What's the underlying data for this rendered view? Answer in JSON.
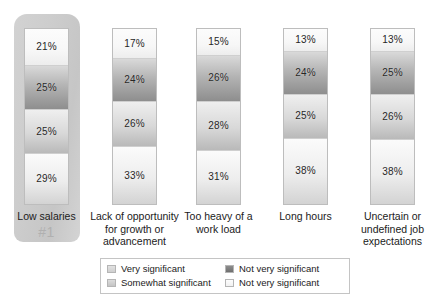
{
  "chart_data": {
    "type": "bar",
    "title": "",
    "subtitle": "",
    "xlabel": "",
    "ylabel": "",
    "ylim": [
      0,
      100
    ],
    "stacked": true,
    "grid": false,
    "legend_position": "bottom",
    "categories": [
      "Low salaries",
      "Lack of opportunity for growth or advancement",
      "Too heavy of a work load",
      "Long hours",
      "Uncertain or undefined job expectations"
    ],
    "series": [
      {
        "name": "Very significant",
        "values": [
          21,
          17,
          15,
          13,
          13
        ]
      },
      {
        "name": "Somewhat significant",
        "values": [
          25,
          24,
          26,
          24,
          25
        ]
      },
      {
        "name": "Not very significant",
        "values": [
          25,
          26,
          28,
          25,
          26
        ]
      },
      {
        "name": "Not very significant",
        "values": [
          29,
          33,
          31,
          38,
          38
        ]
      }
    ],
    "annotations": [
      {
        "category": "Low salaries",
        "text": "#1",
        "type": "rank-badge"
      }
    ]
  },
  "columns": [
    {
      "label": "Low salaries",
      "label_lines": [
        "Low salaries"
      ],
      "rank": "#1",
      "highlighted": true,
      "segments": [
        {
          "value": 21,
          "display": "21%",
          "series": "Very significant"
        },
        {
          "value": 25,
          "display": "25%",
          "series": "Somewhat significant"
        },
        {
          "value": 25,
          "display": "25%",
          "series": "Not very significant"
        },
        {
          "value": 29,
          "display": "29%",
          "series": "Not very significant"
        }
      ]
    },
    {
      "label": "Lack of opportunity for growth or advancement",
      "label_lines": [
        "Lack of opportunity",
        "for growth or",
        "advancement"
      ],
      "rank": "",
      "highlighted": false,
      "segments": [
        {
          "value": 17,
          "display": "17%",
          "series": "Very significant"
        },
        {
          "value": 24,
          "display": "24%",
          "series": "Somewhat significant"
        },
        {
          "value": 26,
          "display": "26%",
          "series": "Not very significant"
        },
        {
          "value": 33,
          "display": "33%",
          "series": "Not very significant"
        }
      ]
    },
    {
      "label": "Too heavy of a work load",
      "label_lines": [
        "Too heavy of a",
        "work load"
      ],
      "rank": "",
      "highlighted": false,
      "segments": [
        {
          "value": 15,
          "display": "15%",
          "series": "Very significant"
        },
        {
          "value": 26,
          "display": "26%",
          "series": "Somewhat significant"
        },
        {
          "value": 28,
          "display": "28%",
          "series": "Not very significant"
        },
        {
          "value": 31,
          "display": "31%",
          "series": "Not very significant"
        }
      ]
    },
    {
      "label": "Long hours",
      "label_lines": [
        "Long hours"
      ],
      "rank": "",
      "highlighted": false,
      "segments": [
        {
          "value": 13,
          "display": "13%",
          "series": "Very significant"
        },
        {
          "value": 24,
          "display": "24%",
          "series": "Somewhat significant"
        },
        {
          "value": 25,
          "display": "25%",
          "series": "Not very significant"
        },
        {
          "value": 38,
          "display": "38%",
          "series": "Not very significant"
        }
      ]
    },
    {
      "label": "Uncertain or undefined job expectations",
      "label_lines": [
        "Uncertain or",
        "undefined job",
        "expectations"
      ],
      "rank": "",
      "highlighted": false,
      "segments": [
        {
          "value": 13,
          "display": "13%",
          "series": "Very significant"
        },
        {
          "value": 25,
          "display": "25%",
          "series": "Somewhat significant"
        },
        {
          "value": 26,
          "display": "26%",
          "series": "Not very significant"
        },
        {
          "value": 38,
          "display": "38%",
          "series": "Not very significant"
        }
      ]
    }
  ],
  "legend": {
    "items": [
      {
        "label": "Very significant",
        "swatch": "light-gray",
        "color": "#d6d6d6"
      },
      {
        "label": "Somewhat significant",
        "swatch": "medium-gray",
        "color": "#cfcfcf"
      },
      {
        "label": "Not very significant",
        "swatch": "dark-gray",
        "color": "#7e7e7e"
      },
      {
        "label": "Not very significant",
        "swatch": "white",
        "color": "#f7f7f7"
      }
    ]
  }
}
